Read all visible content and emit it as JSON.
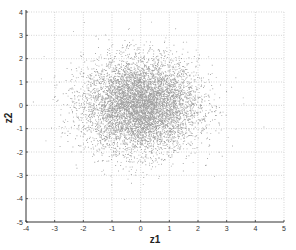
{
  "chart_data": {
    "type": "scatter",
    "title": "",
    "xlabel": "z1",
    "ylabel": "z2",
    "xlim": [
      -4,
      5
    ],
    "ylim": [
      -5,
      4
    ],
    "xticks": [
      -4,
      -3,
      -2,
      -1,
      0,
      1,
      2,
      3,
      4,
      5
    ],
    "yticks": [
      -5,
      -4,
      -3,
      -2,
      -1,
      0,
      1,
      2,
      3,
      4
    ],
    "grid": true,
    "legend": null,
    "series": [
      {
        "name": "samples",
        "distribution": "bivariate standard normal",
        "mean": [
          0,
          0
        ],
        "std": [
          1,
          1
        ],
        "approx_count": 10000,
        "color": "#555555",
        "x_extent_approx": [
          -3.7,
          3.8
        ],
        "y_extent_approx": [
          -4.3,
          3.8
        ]
      }
    ]
  },
  "colors": {
    "axis": "#333333",
    "grid": "#bbbbbb",
    "points": "#555555"
  }
}
